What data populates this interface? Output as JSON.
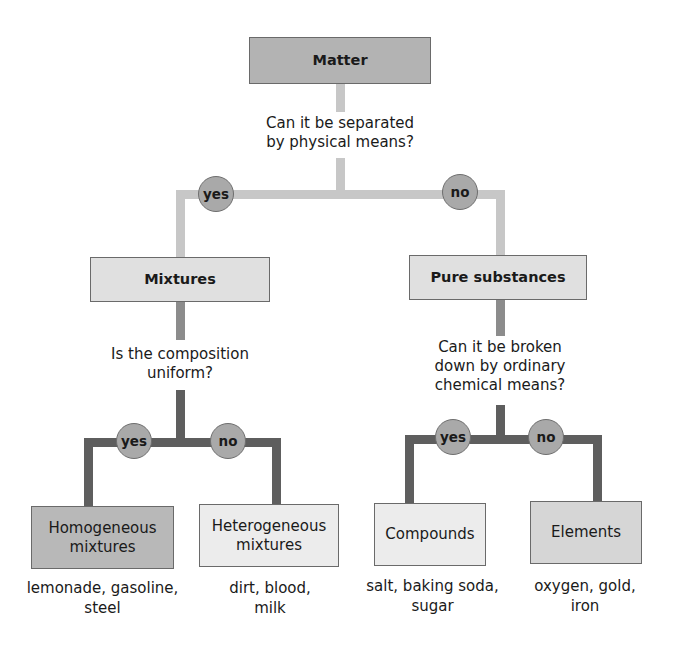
{
  "root": {
    "label": "Matter",
    "question": [
      "Can it be separated",
      "by physical means?"
    ]
  },
  "level1": {
    "yes_label": "yes",
    "no_label": "no",
    "left": {
      "label": "Mixtures",
      "question": [
        "Is the composition",
        "uniform?"
      ],
      "yes_label": "yes",
      "no_label": "no",
      "children": [
        {
          "label": [
            "Homogeneous",
            "mixtures"
          ],
          "examples": [
            "lemonade, gasoline,",
            "steel"
          ]
        },
        {
          "label": [
            "Heterogeneous",
            "mixtures"
          ],
          "examples": [
            "dirt, blood,",
            "milk"
          ]
        }
      ]
    },
    "right": {
      "label": "Pure substances",
      "question": [
        "Can it be broken",
        "down by ordinary",
        "chemical means?"
      ],
      "yes_label": "yes",
      "no_label": "no",
      "children": [
        {
          "label": [
            "Compounds"
          ],
          "examples": [
            "salt, baking soda,",
            "sugar"
          ]
        },
        {
          "label": [
            "Elements"
          ],
          "examples": [
            "oxygen, gold,",
            "iron"
          ]
        }
      ]
    }
  },
  "colors": {
    "matter_box": "#b3b3b3",
    "level1_box": "#e0e0e0",
    "homogeneous_box": "#b8b8b8",
    "heterogeneous_box": "#ececec",
    "compounds_box": "#ececec",
    "elements_box": "#d6d6d6",
    "circle": "#a9a9a9",
    "connector_light": "#c7c7c7",
    "connector_mid": "#8c8c8c",
    "connector_dark": "#5e5e5e"
  }
}
